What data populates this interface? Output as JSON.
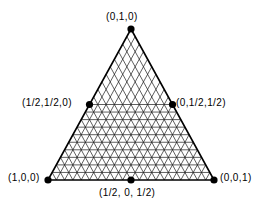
{
  "figure": {
    "type": "2-simplex-barycentric-grid",
    "background_color": "#ffffff",
    "line_color": "#000000",
    "dot_color": "#000000"
  },
  "labels": {
    "top_vertex": "(0,1,0)",
    "left_midpoint": "(1/2,1/2,0)",
    "right_midpoint": "(0,1/2,1/2)",
    "bottom_left_vertex": "(1,0,0)",
    "bottom_right_vertex": "(0,0,1)",
    "bottom_midpoint": "(1/2, 0, 1/2)"
  },
  "geometry": {
    "apex": {
      "x": 131,
      "y": 29
    },
    "bottom_left": {
      "x": 48,
      "y": 180
    },
    "bottom_right": {
      "x": 214,
      "y": 180
    },
    "left_mid": {
      "x": 89.5,
      "y": 104.5
    },
    "right_mid": {
      "x": 172.5,
      "y": 104.5
    },
    "bottom_mid": {
      "x": 131,
      "y": 180
    },
    "grid_divisions": 20,
    "dot_radius": 3.6,
    "edge_stroke": 1.6,
    "grid_stroke": 0.7,
    "horizontals_lower_half_only": true
  },
  "chart_data": {
    "type": "scatter",
    "title": "",
    "xlabel": "",
    "ylabel": "",
    "annotations": [
      {
        "label": "(0,1,0)",
        "barycentric": [
          0,
          1,
          0
        ],
        "role": "vertex",
        "position": "top"
      },
      {
        "label": "(1,0,0)",
        "barycentric": [
          1,
          0,
          0
        ],
        "role": "vertex",
        "position": "bottom-left"
      },
      {
        "label": "(0,0,1)",
        "barycentric": [
          0,
          0,
          1
        ],
        "role": "vertex",
        "position": "bottom-right"
      },
      {
        "label": "(1/2,1/2,0)",
        "barycentric": [
          0.5,
          0.5,
          0
        ],
        "role": "midpoint",
        "position": "left-edge"
      },
      {
        "label": "(0,1/2,1/2)",
        "barycentric": [
          0,
          0.5,
          0.5
        ],
        "role": "midpoint",
        "position": "right-edge"
      },
      {
        "label": "(1/2, 0, 1/2)",
        "barycentric": [
          0.5,
          0,
          0.5
        ],
        "role": "midpoint",
        "position": "bottom-edge"
      }
    ],
    "grid": true,
    "legend": "none"
  }
}
